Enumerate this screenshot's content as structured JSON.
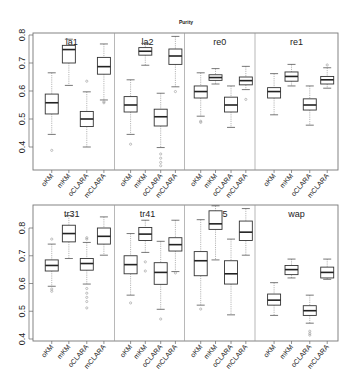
{
  "figure": {
    "title": "Purity"
  },
  "chart_data": {
    "type": "boxplot",
    "title": "Purity",
    "xlabel": "",
    "ylabel": "",
    "categories": [
      "oKM",
      "mKM",
      "oCLARA",
      "mCLARA"
    ],
    "rows": [
      {
        "yticks": [
          "0.4",
          "0.5",
          "0.6",
          "0.7",
          "0.8"
        ],
        "ylim": [
          0.32,
          0.81
        ],
        "panels": [
          {
            "name": "la1",
            "boxes": [
              {
                "label": "oKM",
                "whisker_low": 0.445,
                "q1": 0.518,
                "median": 0.558,
                "q3": 0.589,
                "whisker_high": 0.665,
                "outliers": [
                  0.388
                ]
              },
              {
                "label": "mKM",
                "whisker_low": 0.62,
                "q1": 0.7,
                "median": 0.748,
                "q3": 0.763,
                "whisker_high": 0.785,
                "outliers": []
              },
              {
                "label": "oCLARA",
                "whisker_low": 0.4,
                "q1": 0.473,
                "median": 0.5,
                "q3": 0.527,
                "whisker_high": 0.597,
                "outliers": [
                  0.635
                ]
              },
              {
                "label": "mCLARA",
                "whisker_low": 0.568,
                "q1": 0.66,
                "median": 0.687,
                "q3": 0.72,
                "whisker_high": 0.768,
                "outliers": [
                  0.558,
                  0.562
                ]
              }
            ]
          },
          {
            "name": "la2",
            "boxes": [
              {
                "label": "oKM",
                "whisker_low": 0.445,
                "q1": 0.525,
                "median": 0.55,
                "q3": 0.58,
                "whisker_high": 0.64,
                "outliers": [
                  0.41
                ]
              },
              {
                "label": "mKM",
                "whisker_low": 0.692,
                "q1": 0.728,
                "median": 0.742,
                "q3": 0.755,
                "whisker_high": 0.77,
                "outliers": []
              },
              {
                "label": "oCLARA",
                "whisker_low": 0.398,
                "q1": 0.475,
                "median": 0.508,
                "q3": 0.535,
                "whisker_high": 0.592,
                "outliers": [
                  0.375,
                  0.36,
                  0.345,
                  0.333
                ]
              },
              {
                "label": "mCLARA",
                "whisker_low": 0.615,
                "q1": 0.695,
                "median": 0.725,
                "q3": 0.75,
                "whisker_high": 0.795,
                "outliers": [
                  0.598
                ]
              }
            ]
          },
          {
            "name": "re0",
            "boxes": [
              {
                "label": "oKM",
                "whisker_low": 0.51,
                "q1": 0.575,
                "median": 0.598,
                "q3": 0.618,
                "whisker_high": 0.665,
                "outliers": [
                  0.492,
                  0.488
                ]
              },
              {
                "label": "mKM",
                "whisker_low": 0.625,
                "q1": 0.638,
                "median": 0.648,
                "q3": 0.658,
                "whisker_high": 0.68,
                "outliers": []
              },
              {
                "label": "oCLARA",
                "whisker_low": 0.47,
                "q1": 0.525,
                "median": 0.55,
                "q3": 0.578,
                "whisker_high": 0.618,
                "outliers": []
              },
              {
                "label": "mCLARA",
                "whisker_low": 0.605,
                "q1": 0.622,
                "median": 0.637,
                "q3": 0.65,
                "whisker_high": 0.688,
                "outliers": [
                  0.57
                ]
              }
            ]
          },
          {
            "name": "re1",
            "boxes": [
              {
                "label": "oKM",
                "whisker_low": 0.515,
                "q1": 0.575,
                "median": 0.598,
                "q3": 0.612,
                "whisker_high": 0.662,
                "outliers": []
              },
              {
                "label": "mKM",
                "whisker_low": 0.618,
                "q1": 0.635,
                "median": 0.652,
                "q3": 0.668,
                "whisker_high": 0.695,
                "outliers": []
              },
              {
                "label": "oCLARA",
                "whisker_low": 0.478,
                "q1": 0.532,
                "median": 0.55,
                "q3": 0.572,
                "whisker_high": 0.618,
                "outliers": []
              },
              {
                "label": "mCLARA",
                "whisker_low": 0.61,
                "q1": 0.625,
                "median": 0.64,
                "q3": 0.652,
                "whisker_high": 0.683,
                "outliers": [
                  0.693
                ]
              }
            ]
          }
        ]
      },
      {
        "yticks": [
          "0.4",
          "0.5",
          "0.6",
          "0.7",
          "0.8"
        ],
        "ylim": [
          0.397,
          0.885
        ],
        "panels": [
          {
            "name": "tr31",
            "boxes": [
              {
                "label": "oKM",
                "whisker_low": 0.59,
                "q1": 0.645,
                "median": 0.665,
                "q3": 0.685,
                "whisker_high": 0.742,
                "outliers": [
                  0.76,
                  0.58,
                  0.572
                ]
              },
              {
                "label": "mKM",
                "whisker_low": 0.69,
                "q1": 0.75,
                "median": 0.78,
                "q3": 0.81,
                "whisker_high": 0.845,
                "outliers": []
              },
              {
                "label": "oCLARA",
                "whisker_low": 0.598,
                "q1": 0.648,
                "median": 0.672,
                "q3": 0.69,
                "whisker_high": 0.748,
                "outliers": [
                  0.765,
                  0.76,
                  0.582,
                  0.565,
                  0.55,
                  0.535,
                  0.512
                ]
              },
              {
                "label": "mCLARA",
                "whisker_low": 0.702,
                "q1": 0.742,
                "median": 0.77,
                "q3": 0.8,
                "whisker_high": 0.84,
                "outliers": []
              }
            ]
          },
          {
            "name": "tr41",
            "boxes": [
              {
                "label": "oKM",
                "whisker_low": 0.558,
                "q1": 0.635,
                "median": 0.668,
                "q3": 0.7,
                "whisker_high": 0.78,
                "outliers": [
                  0.53
                ]
              },
              {
                "label": "mKM",
                "whisker_low": 0.712,
                "q1": 0.755,
                "median": 0.778,
                "q3": 0.802,
                "whisker_high": 0.828,
                "outliers": [
                  0.678,
                  0.645
                ]
              },
              {
                "label": "oCLARA",
                "whisker_low": 0.507,
                "q1": 0.597,
                "median": 0.64,
                "q3": 0.675,
                "whisker_high": 0.752,
                "outliers": [
                  0.472
                ]
              },
              {
                "label": "mCLARA",
                "whisker_low": 0.643,
                "q1": 0.717,
                "median": 0.74,
                "q3": 0.765,
                "whisker_high": 0.828,
                "outliers": [
                  0.638
                ]
              }
            ]
          },
          {
            "name": "tr45",
            "boxes": [
              {
                "label": "oKM",
                "whisker_low": 0.522,
                "q1": 0.628,
                "median": 0.682,
                "q3": 0.715,
                "whisker_high": 0.83,
                "outliers": [
                  0.508
                ]
              },
              {
                "label": "mKM",
                "whisker_low": 0.685,
                "q1": 0.795,
                "median": 0.815,
                "q3": 0.862,
                "whisker_high": 0.88,
                "outliers": []
              },
              {
                "label": "oCLARA",
                "whisker_low": 0.487,
                "q1": 0.598,
                "median": 0.635,
                "q3": 0.682,
                "whisker_high": 0.76,
                "outliers": []
              },
              {
                "label": "mCLARA",
                "whisker_low": 0.702,
                "q1": 0.755,
                "median": 0.785,
                "q3": 0.825,
                "whisker_high": 0.87,
                "outliers": []
              }
            ]
          },
          {
            "name": "wap",
            "boxes": [
              {
                "label": "oKM",
                "whisker_low": 0.485,
                "q1": 0.522,
                "median": 0.54,
                "q3": 0.562,
                "whisker_high": 0.603,
                "outliers": []
              },
              {
                "label": "mKM",
                "whisker_low": 0.62,
                "q1": 0.632,
                "median": 0.65,
                "q3": 0.665,
                "whisker_high": 0.688,
                "outliers": []
              },
              {
                "label": "oCLARA",
                "whisker_low": 0.457,
                "q1": 0.485,
                "median": 0.502,
                "q3": 0.52,
                "whisker_high": 0.558,
                "outliers": [
                  0.428,
                  0.42,
                  0.414
                ]
              },
              {
                "label": "mCLARA",
                "whisker_low": 0.615,
                "q1": 0.62,
                "median": 0.64,
                "q3": 0.659,
                "whisker_high": 0.688,
                "outliers": []
              }
            ]
          }
        ]
      }
    ]
  }
}
